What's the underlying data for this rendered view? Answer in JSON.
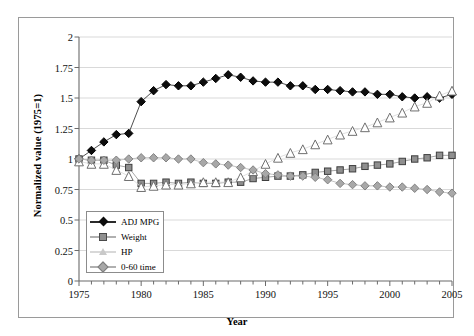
{
  "chart_data": {
    "type": "line",
    "title": "",
    "xlabel": "Year",
    "ylabel": "Normalized value (1975=1)",
    "xlim": [
      1975,
      2005
    ],
    "ylim": [
      0,
      2
    ],
    "ytick_labels": [
      "0",
      "0.25",
      "0.5",
      "0.75",
      "1",
      "1.25",
      "1.5",
      "1.75",
      "2"
    ],
    "ytick_values": [
      0,
      0.25,
      0.5,
      0.75,
      1,
      1.25,
      1.5,
      1.75,
      2
    ],
    "xtick_labels": [
      "1975",
      "1980",
      "1985",
      "1990",
      "1995",
      "2000",
      "2005"
    ],
    "xtick_values": [
      1975,
      1980,
      1985,
      1990,
      1995,
      2000,
      2005
    ],
    "grid": "horizontal",
    "legend_position": "lower-left inside",
    "x": [
      1975,
      1976,
      1977,
      1978,
      1979,
      1980,
      1981,
      1982,
      1983,
      1984,
      1985,
      1986,
      1987,
      1988,
      1989,
      1990,
      1991,
      1992,
      1993,
      1994,
      1995,
      1996,
      1997,
      1998,
      1999,
      2000,
      2001,
      2002,
      2003,
      2004,
      2005
    ],
    "series": [
      {
        "name": "ADJ MPG",
        "marker": "diamond",
        "color": "#0d0d0d",
        "values": [
          1.0,
          1.07,
          1.14,
          1.2,
          1.21,
          1.47,
          1.56,
          1.61,
          1.6,
          1.6,
          1.63,
          1.66,
          1.69,
          1.67,
          1.64,
          1.63,
          1.63,
          1.6,
          1.6,
          1.57,
          1.57,
          1.56,
          1.55,
          1.55,
          1.53,
          1.53,
          1.51,
          1.5,
          1.51,
          1.5,
          1.53
        ]
      },
      {
        "name": "Weight",
        "marker": "square",
        "color": "#8f8f8f",
        "values": [
          1.0,
          0.99,
          0.99,
          0.95,
          0.93,
          0.8,
          0.8,
          0.81,
          0.8,
          0.81,
          0.8,
          0.8,
          0.81,
          0.81,
          0.84,
          0.85,
          0.86,
          0.86,
          0.87,
          0.89,
          0.9,
          0.91,
          0.92,
          0.94,
          0.95,
          0.96,
          0.98,
          1.0,
          1.01,
          1.03,
          1.03
        ]
      },
      {
        "name": "HP",
        "marker": "triangle",
        "color": "#d0d0d0",
        "values": [
          0.98,
          0.96,
          0.96,
          0.91,
          0.86,
          0.77,
          0.78,
          0.79,
          0.79,
          0.8,
          0.81,
          0.81,
          0.81,
          0.85,
          0.9,
          0.96,
          1.01,
          1.05,
          1.08,
          1.12,
          1.16,
          1.2,
          1.23,
          1.26,
          1.3,
          1.34,
          1.38,
          1.43,
          1.46,
          1.52,
          1.56
        ]
      },
      {
        "name": "0-60 time",
        "marker": "diamond",
        "color": "#a8a8a8",
        "values": [
          1.0,
          0.99,
          0.99,
          0.99,
          1.0,
          1.01,
          1.01,
          1.01,
          1.0,
          1.0,
          0.97,
          0.96,
          0.95,
          0.93,
          0.91,
          0.88,
          0.87,
          0.86,
          0.86,
          0.85,
          0.83,
          0.8,
          0.79,
          0.78,
          0.78,
          0.77,
          0.77,
          0.76,
          0.75,
          0.73,
          0.72
        ]
      }
    ]
  },
  "legend": {
    "items": [
      {
        "label": "ADJ MPG",
        "marker": "diamond-dark-icon"
      },
      {
        "label": "Weight",
        "marker": "square-gray-icon"
      },
      {
        "label": "HP",
        "marker": "triangle-pale-icon"
      },
      {
        "label": "0-60 time",
        "marker": "diamond-gray-icon"
      }
    ]
  }
}
